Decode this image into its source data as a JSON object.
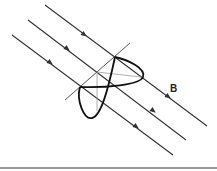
{
  "figure": {
    "field_label": "B",
    "field_lines": [
      {
        "id": "line-1",
        "x1": 45,
        "y1": 5,
        "x2": 207,
        "y2": 126,
        "arrows": [
          [
            83,
            34
          ],
          [
            167,
            96
          ]
        ]
      },
      {
        "id": "line-2",
        "x1": 28,
        "y1": 20,
        "x2": 186,
        "y2": 140,
        "arrows": [
          [
            67,
            48
          ],
          [
            153,
            110
          ]
        ]
      },
      {
        "id": "line-3",
        "x1": 12,
        "y1": 35,
        "x2": 173,
        "y2": 155,
        "arrows": [
          [
            50,
            62
          ],
          [
            136,
            126
          ]
        ]
      }
    ],
    "axis_line": {
      "x1": 65,
      "y1": 100,
      "x2": 130,
      "y2": 43
    },
    "colors": {
      "line": "#333333",
      "loop": "#111111",
      "guide": "#9a9a9a",
      "rule": "#9a9a9a"
    }
  }
}
